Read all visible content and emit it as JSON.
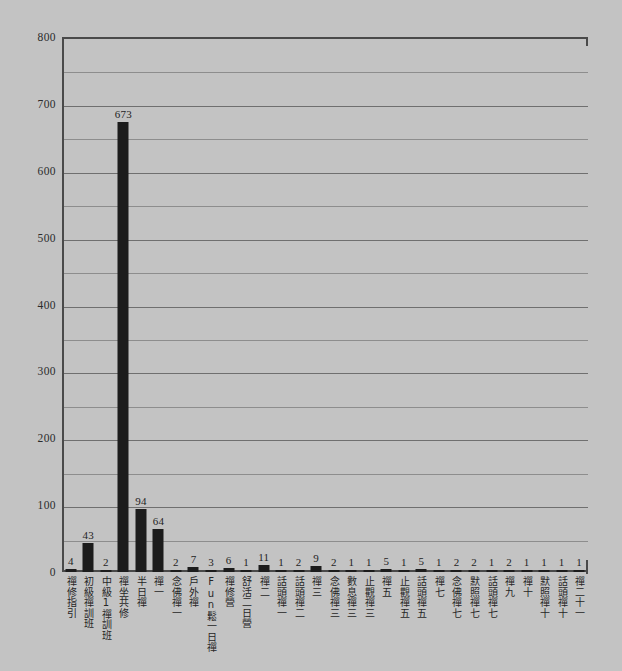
{
  "chart_data": {
    "type": "bar",
    "title": "",
    "subtitle": "",
    "xlabel": "",
    "ylabel": "",
    "ylim": [
      0,
      800
    ],
    "ytick_labels": [
      "0",
      "100",
      "200",
      "300",
      "400",
      "500",
      "600",
      "700",
      "800"
    ],
    "ytick_values": [
      0,
      100,
      200,
      300,
      400,
      500,
      600,
      700,
      800
    ],
    "minor_gridline_values": [
      50,
      150,
      250,
      350,
      450,
      550,
      650,
      750
    ],
    "grid": true,
    "legend": "none",
    "bar_color": "#1c1c1c",
    "background_color": "#c3c3c3",
    "axis_color": "#4a4a4a",
    "gridline_color": "#6f6f6f",
    "show_value_labels": true,
    "categories": [
      "禪修指引",
      "初級禪訓班",
      "中級1禪訓班",
      "禪坐共修",
      "半日禪",
      "禪一",
      "念佛禪一",
      "戶外禪",
      "Fun鬆一日禪",
      "禪修營",
      "舒活二日營",
      "禪二",
      "話頭禪一",
      "話頭禪二",
      "禪三",
      "念佛禪三",
      "數息禪三",
      "止觀禪三",
      "禪五",
      "止觀禪五",
      "話頭禪五",
      "禪七",
      "念佛禪七",
      "默照禪七",
      "話頭禪七",
      "禪九",
      "禪十",
      "默照禪十",
      "話頭禪十",
      "禪二十一"
    ],
    "values": [
      4,
      43,
      2,
      673,
      94,
      64,
      2,
      7,
      3,
      6,
      1,
      11,
      1,
      2,
      9,
      2,
      1,
      1,
      5,
      1,
      5,
      1,
      2,
      2,
      1,
      2,
      1,
      1,
      1,
      1
    ]
  }
}
